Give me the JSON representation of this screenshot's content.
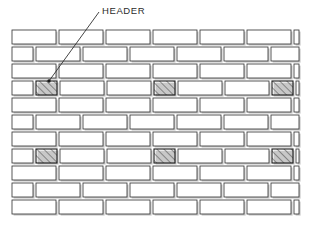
{
  "figure": {
    "title_label": "HEADER",
    "colors": {
      "background": "#ffffff",
      "mortar": "#ffffff",
      "brick_outline": "#3a3a3a",
      "brick_face": "#ffffff",
      "brick_shadow": "#9a9a9a",
      "header_outline": "#1a1a1a",
      "header_hatch": "#4a4a4a",
      "leader_line": "#303030",
      "label_text": "#2b2b2b"
    },
    "annotation": {
      "label": "HEADER",
      "label_x": 102,
      "label_y": 14,
      "leader_from_x": 99,
      "leader_from_y": 12,
      "leader_to_x": 49,
      "leader_to_y": 81,
      "pointer_dot_x": 49,
      "pointer_dot_y": 81
    },
    "wall": {
      "x": 12,
      "y": 30,
      "width": 287,
      "height": 188,
      "course_count": 11,
      "course_height": 17,
      "mortar_gap": 3,
      "stretcher_length": 47,
      "header_length": 24,
      "bond_type": "running bond",
      "courses": [
        {
          "index": 0,
          "kind": "stretcher",
          "offset": 0,
          "headers": []
        },
        {
          "index": 1,
          "kind": "stretcher",
          "offset": 24,
          "headers": []
        },
        {
          "index": 2,
          "kind": "stretcher",
          "offset": 0,
          "headers": []
        },
        {
          "index": 3,
          "kind": "header-course",
          "offset": 24,
          "headers": [
            0,
            3,
            6
          ]
        },
        {
          "index": 4,
          "kind": "stretcher",
          "offset": 0,
          "headers": []
        },
        {
          "index": 5,
          "kind": "stretcher",
          "offset": 24,
          "headers": []
        },
        {
          "index": 6,
          "kind": "stretcher",
          "offset": 0,
          "headers": []
        },
        {
          "index": 7,
          "kind": "header-course",
          "offset": 24,
          "headers": [
            0,
            3,
            6
          ]
        },
        {
          "index": 8,
          "kind": "stretcher",
          "offset": 0,
          "headers": []
        },
        {
          "index": 9,
          "kind": "stretcher",
          "offset": 24,
          "headers": []
        },
        {
          "index": 10,
          "kind": "stretcher",
          "offset": 0,
          "headers": []
        }
      ]
    }
  }
}
